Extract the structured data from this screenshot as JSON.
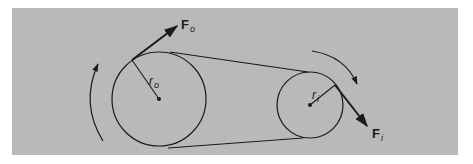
{
  "figure": {
    "type": "belt-drive-pulley-diagram",
    "background_color": "#b9b9b9",
    "line_color": "#1a1a1a",
    "driver_pulley": {
      "center": [
        159,
        99
      ],
      "radius": 47,
      "radius_label": {
        "main": "r",
        "sub": "o"
      },
      "force_label": {
        "main": "F",
        "sub": "o"
      },
      "rotation": "counterclockwise"
    },
    "driven_pulley": {
      "center": [
        310,
        105
      ],
      "radius": 33,
      "radius_label": {
        "main": "r",
        "sub": "i"
      },
      "force_label": {
        "main": "F",
        "sub": "i"
      },
      "rotation": "clockwise"
    },
    "belt": {
      "top_segment": [
        [
          170,
          52
        ],
        [
          308,
          72
        ]
      ],
      "bottom_segment": [
        [
          168,
          148
        ],
        [
          303,
          138
        ]
      ]
    }
  }
}
